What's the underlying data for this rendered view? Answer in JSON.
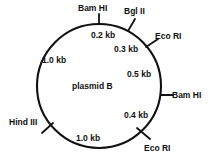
{
  "diagram": {
    "type": "plasmid-restriction-map",
    "center_label": "plasmid B",
    "circle": {
      "cx": 99,
      "cy": 86,
      "r": 62,
      "stroke": "#111111",
      "stroke_width": 2.1
    },
    "enzyme_sites": [
      {
        "name": "bam-hi-top",
        "label": "Bam HI",
        "angle_deg": 90,
        "label_x": 78,
        "label_y": 3,
        "tick": {
          "x1": 99,
          "y1": 24,
          "x2": 99,
          "y2": 14
        }
      },
      {
        "name": "bgl-ii",
        "label": "Bgl II",
        "angle_deg": 62,
        "label_x": 124,
        "label_y": 6,
        "tick": {
          "x1": 128,
          "y1": 31,
          "x2": 135,
          "y2": 19
        }
      },
      {
        "name": "eco-ri-upper-right",
        "label": "Eco RI",
        "angle_deg": 40,
        "label_x": 155,
        "label_y": 31,
        "tick": {
          "x1": 146,
          "y1": 47,
          "x2": 158,
          "y2": 39
        }
      },
      {
        "name": "bam-hi-right",
        "label": "Bam HI",
        "angle_deg": 0,
        "label_x": 172,
        "label_y": 90,
        "tick": {
          "x1": 161,
          "y1": 95,
          "x2": 173,
          "y2": 95
        }
      },
      {
        "name": "eco-ri-lower-right",
        "label": "Eco RI",
        "angle_deg": -53,
        "label_x": 144,
        "label_y": 143,
        "tick": {
          "x1": 137,
          "y1": 128,
          "x2": 150,
          "y2": 139
        }
      },
      {
        "name": "hind-iii",
        "label": "Hind III",
        "angle_deg": 218,
        "label_x": 9,
        "label_y": 117,
        "tick": {
          "x1": 53,
          "y1": 123,
          "x2": 42,
          "y2": 133
        }
      }
    ],
    "segment_labels": [
      {
        "name": "segment-0-2kb",
        "label": "0.2 kb",
        "x": 91,
        "y": 30
      },
      {
        "name": "segment-0-3kb",
        "label": "0.3 kb",
        "x": 114,
        "y": 44
      },
      {
        "name": "segment-0-5kb",
        "label": "0.5 kb",
        "x": 127,
        "y": 69
      },
      {
        "name": "segment-0-4kb",
        "label": "0.4 kb",
        "x": 124,
        "y": 110
      },
      {
        "name": "segment-1-0kb-bottom",
        "label": "1.0 kb",
        "x": 76,
        "y": 133
      },
      {
        "name": "segment-1-0kb-left",
        "label": "1.0 kb",
        "x": 42,
        "y": 55
      }
    ],
    "colors": {
      "stroke": "#111111",
      "text": "#111111",
      "background": "#ffffff"
    }
  }
}
